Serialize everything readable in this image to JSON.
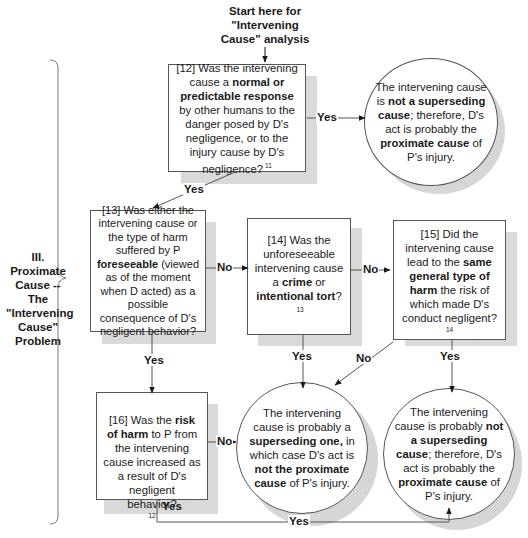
{
  "start": {
    "line1": "Start here for",
    "line2": "\"Intervening",
    "line3": "Cause\" analysis"
  },
  "section": {
    "line1": "III.",
    "line2": "Proximate",
    "line3": "Cause -- The",
    "line4": "\"Intervening",
    "line5": "Cause\"",
    "line6": "Problem"
  },
  "nodes": {
    "q12": {
      "pre": "[12] Was the intervening cause a ",
      "bold1": "normal or predictable response",
      "post": " by other humans to the danger posed by D's negligence, or to the injury cause by D's negligence?",
      "footnote": "11"
    },
    "q13": {
      "pre": "[13] Was either the intervening cause or the type of harm suffered by P ",
      "bold1": "foreseeable",
      "post": " (viewed as of the moment when D acted) as a possible consequence of D's negligent behavior?"
    },
    "q14": {
      "pre": "[14] Was the unforeseeable intervening cause a ",
      "bold1": "crime",
      "mid": " or ",
      "bold2": "intentional tort",
      "post": "?",
      "footnote": "13"
    },
    "q15": {
      "pre": "[15] Did the intervening cause lead to the ",
      "bold1": "same general type of harm",
      "post": " the risk of which made D's conduct negligent?",
      "footnote": "14"
    },
    "q16": {
      "pre": "[16] Was the ",
      "bold1": "risk of harm",
      "post": " to P from the intervening cause increased as a result of D's negligent behavior?",
      "footnote": "12"
    },
    "r_top": {
      "pre": "The intervening cause is ",
      "bold1": "not a superseding cause",
      "mid": "; therefore, D's act is probably the ",
      "bold2": "proximate cause",
      "post": " of P's injury."
    },
    "r_superseding": {
      "pre": "The intervening cause is probably a ",
      "bold1": "superseding one,",
      "mid": " in which case D's act is ",
      "bold2": "not the proximate cause",
      "post": " of P's injury."
    },
    "r_bottom_right": {
      "pre": "The intervening cause is probably ",
      "bold1": "not a superseding cause",
      "mid": "; therefore, D's act is probably the ",
      "bold2": "proximate cause",
      "post": " of P's injury."
    }
  },
  "edges": {
    "q12_yes_right": "Yes",
    "q12_yes_down": "Yes",
    "q13_no": "No",
    "q13_yes": "Yes",
    "q14_no": "No",
    "q14_yes": "Yes",
    "q15_no": "No",
    "q15_yes": "Yes",
    "q16_no": "No",
    "q16_yes_down": "Yes",
    "q16_yes_bottom": "Yes"
  }
}
